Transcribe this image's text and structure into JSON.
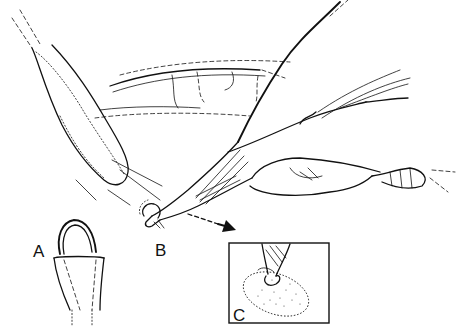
{
  "figure": {
    "type": "medical line illustration",
    "labels": {
      "a": "A",
      "b": "B",
      "c": "C"
    },
    "inset": {
      "label": "C",
      "shows": "instrument tip engaging stippled oval tissue area"
    },
    "callout_arrow": "points from instrument tip (B) to inset (C)",
    "colors": {
      "ink": "#111111",
      "background": "#ffffff"
    }
  }
}
